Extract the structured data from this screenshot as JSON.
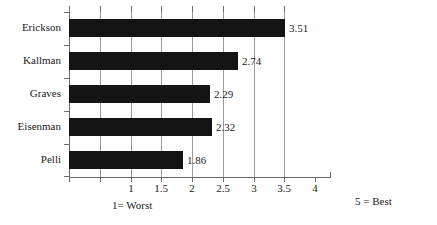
{
  "chart_data": {
    "type": "bar",
    "orientation": "horizontal",
    "title": "",
    "xlabel": "",
    "ylabel": "",
    "categories": [
      "Erickson",
      "Kallman",
      "Graves",
      "Eisenman",
      "Pelli"
    ],
    "values": [
      3.51,
      2.74,
      2.29,
      2.32,
      1.86
    ],
    "data_labels": [
      "3.51",
      "2.74",
      "2.29",
      "2.32",
      "1.86"
    ],
    "xlim": [
      0,
      4
    ],
    "xticks": [
      0,
      0.5,
      1,
      1.5,
      2,
      2.5,
      3,
      3.5,
      4
    ],
    "xtick_labels": [
      "",
      "",
      "1",
      "1.5",
      "2",
      "2.5",
      "3",
      "3.5",
      "4"
    ],
    "grid": true,
    "grid_axis": "x",
    "legend": null,
    "bar_color": "#141414",
    "grid_color": "#9a9a9a",
    "axis_color": "#6b6b6b",
    "background_color": "#ffffff",
    "annotations": [
      {
        "text": "1= Worst",
        "position": "below-axis-left"
      },
      {
        "text": "5 = Best",
        "position": "bottom-right"
      }
    ]
  },
  "notes": {
    "worst": "1= Worst",
    "best": "5 = Best"
  }
}
